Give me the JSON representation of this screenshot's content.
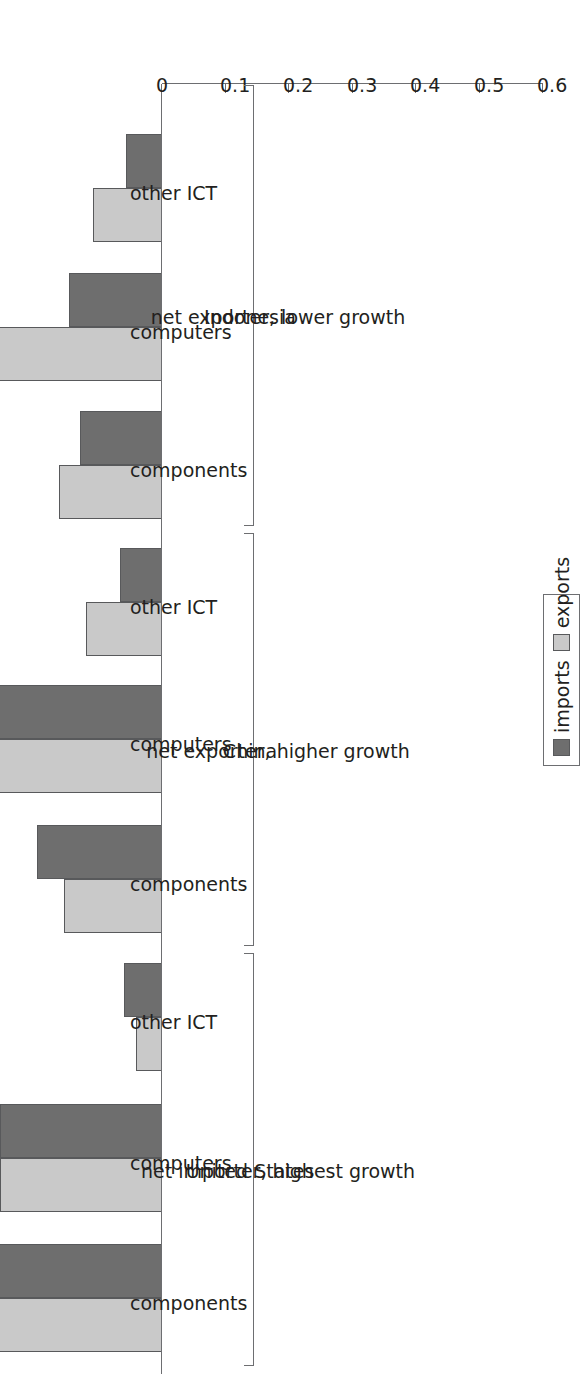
{
  "chart_data": {
    "type": "bar",
    "orientation": "horizontal",
    "title": "",
    "xlabel": "",
    "ylabel": "",
    "xlim": [
      0,
      0.6
    ],
    "ticks": [
      "0",
      "0.1",
      "0.2",
      "0.3",
      "0.4",
      "0.5",
      "0.6"
    ],
    "tick_values": [
      0,
      0.1,
      0.2,
      0.3,
      0.4,
      0.5,
      0.6
    ],
    "grid": false,
    "legend_position": "right-middle",
    "legend": [
      "imports",
      "exports"
    ],
    "series": [
      {
        "name": "imports",
        "color": "#6e6e6e",
        "values": [
          0.057,
          0.147,
          0.129,
          0.066,
          0.375,
          0.197,
          0.06,
          0.255,
          0.258
        ]
      },
      {
        "name": "exports",
        "color": "#c9c9c9",
        "values": [
          0.109,
          0.485,
          0.162,
          0.12,
          0.29,
          0.154,
          0.041,
          0.255,
          0.301
        ]
      }
    ],
    "categories": [
      "other ICT",
      "computers",
      "components",
      "other ICT",
      "computers",
      "components",
      "other ICT",
      "computers",
      "components"
    ],
    "groups": [
      {
        "name": "Indonesia",
        "subtitle": "net exporter, lower growth",
        "categories": [
          "other ICT",
          "computers",
          "components"
        ]
      },
      {
        "name": "China",
        "subtitle": "net exporter, higher growth",
        "categories": [
          "other ICT",
          "computers",
          "components"
        ]
      },
      {
        "name": "United States",
        "subtitle": "net importer, highest growth",
        "categories": [
          "other ICT",
          "computers",
          "components"
        ]
      }
    ]
  },
  "axis": {
    "labels": [
      "0",
      "0.1",
      "0.2",
      "0.3",
      "0.4",
      "0.5",
      "0.6"
    ]
  },
  "legend": {
    "items": [
      {
        "label": "imports",
        "color": "#6e6e6e"
      },
      {
        "label": "exports",
        "color": "#c9c9c9"
      }
    ]
  },
  "colors": {
    "imports": "#6e6e6e",
    "exports": "#c9c9c9",
    "axis": "#6d6e71",
    "text": "#231f20",
    "background": "#ffffff"
  }
}
